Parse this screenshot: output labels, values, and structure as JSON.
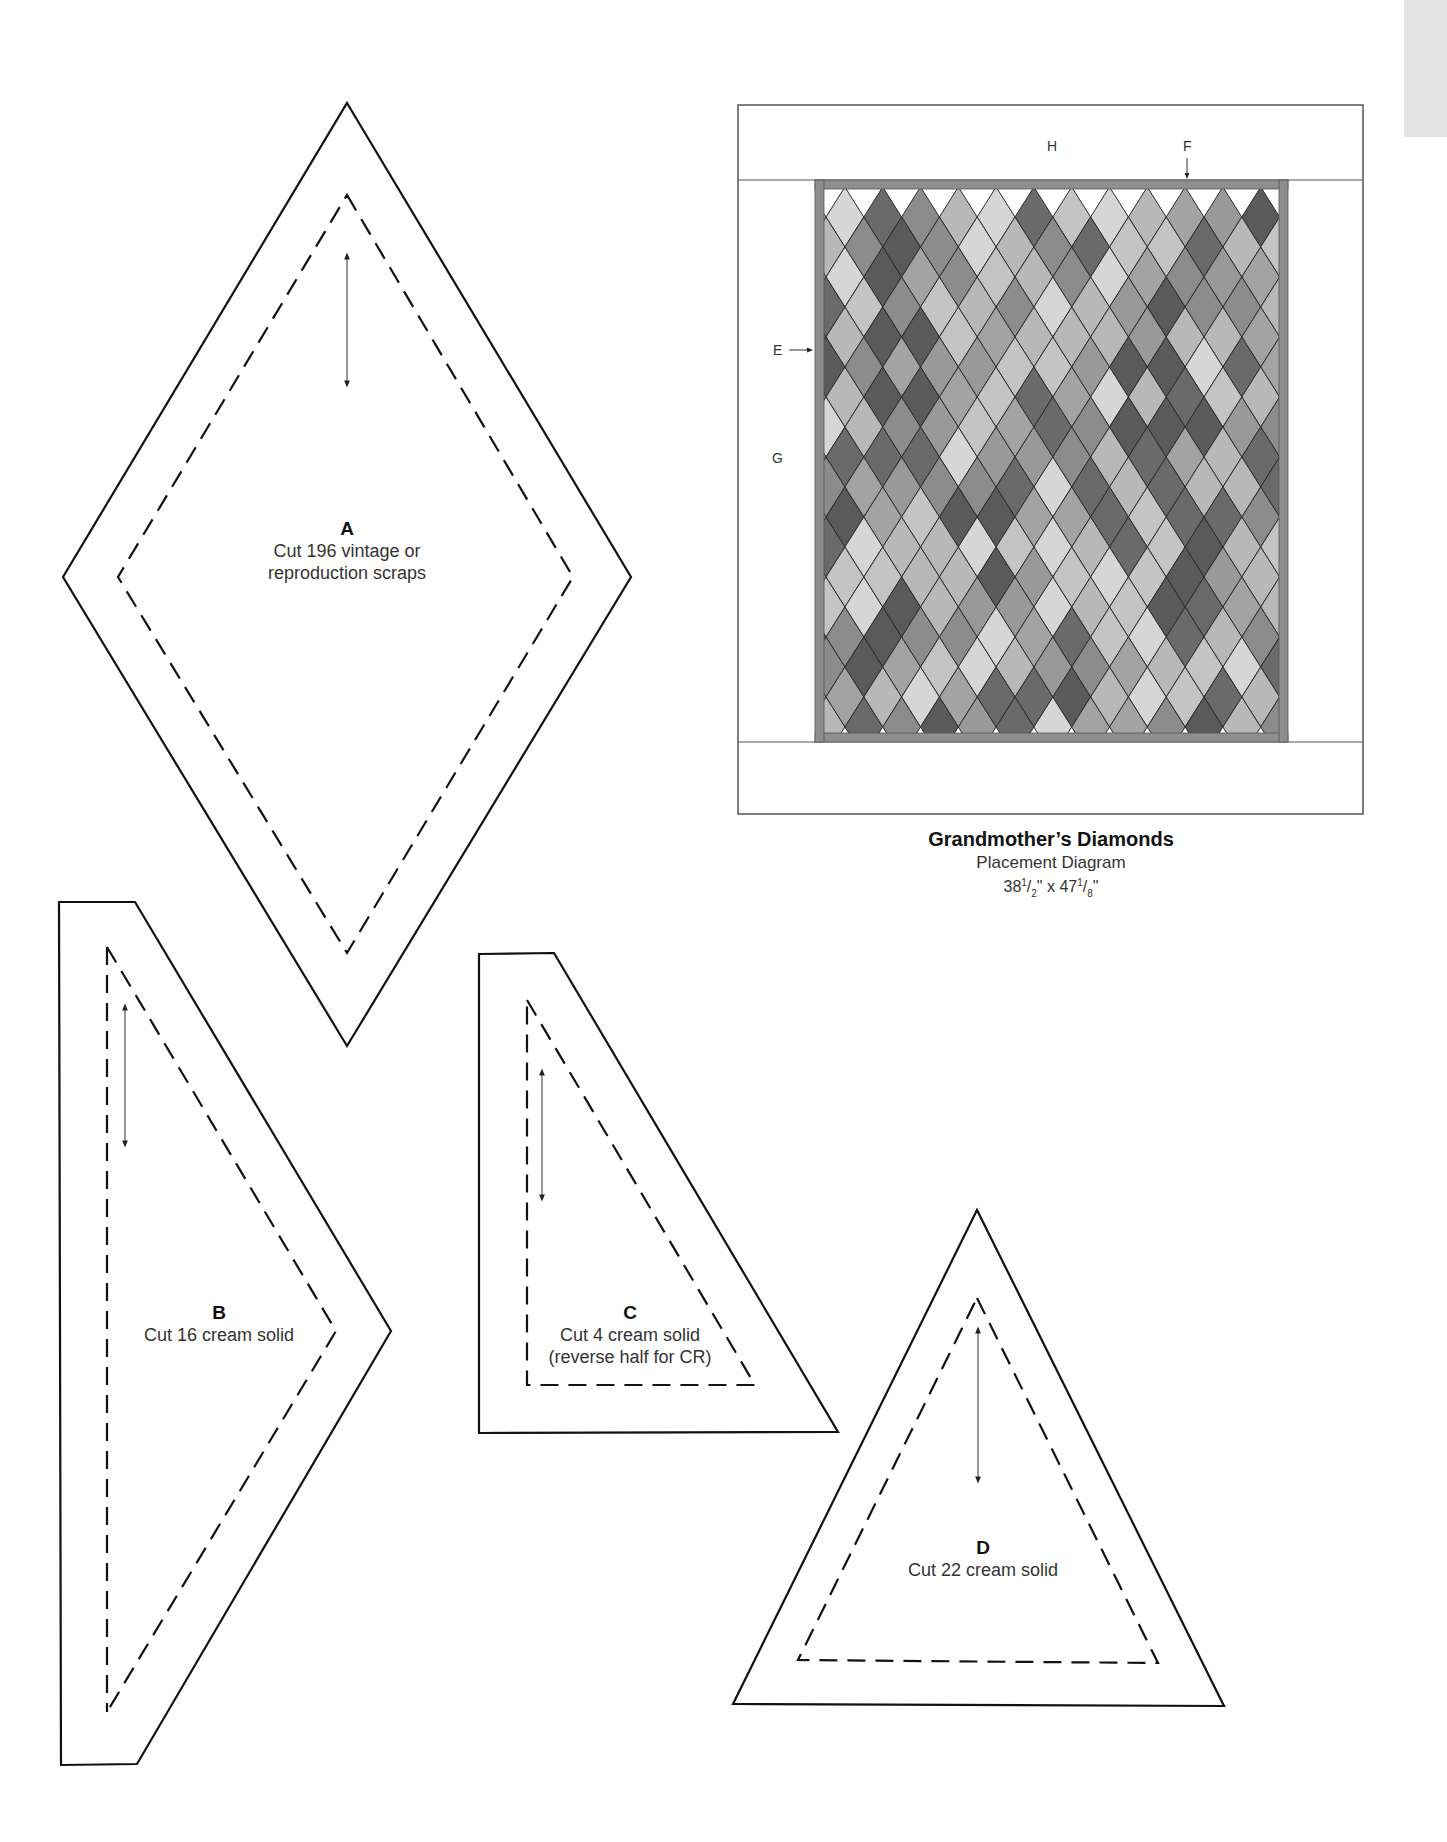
{
  "page": {
    "tab_color": "#e4e4e4"
  },
  "templates": [
    {
      "id": "A",
      "letter": "A",
      "lines": [
        "Cut 196 vintage or",
        "reproduction scraps"
      ],
      "shape": "diamond",
      "outer": [
        [
          347,
          103
        ],
        [
          631,
          577
        ],
        [
          347,
          1046
        ],
        [
          63,
          577
        ]
      ],
      "inner": [
        [
          347,
          195
        ],
        [
          573,
          577
        ],
        [
          347,
          953
        ],
        [
          118,
          577
        ]
      ],
      "grain_arrow": [
        [
          347,
          256
        ],
        [
          347,
          384
        ]
      ],
      "label_pos": [
        347,
        518
      ]
    },
    {
      "id": "B",
      "letter": "B",
      "lines": [
        "Cut 16 cream solid"
      ],
      "shape": "half-diamond-trimmed",
      "outer": [
        [
          59,
          902
        ],
        [
          135,
          902
        ],
        [
          391,
          1331
        ],
        [
          137,
          1764
        ],
        [
          61,
          1765
        ]
      ],
      "inner": [
        [
          107,
          947
        ],
        [
          336,
          1331
        ],
        [
          107,
          1712
        ]
      ],
      "grain_arrow": [
        [
          125,
          1007
        ],
        [
          125,
          1144
        ]
      ],
      "label_pos": [
        219,
        1302
      ]
    },
    {
      "id": "C",
      "letter": "C",
      "lines": [
        "Cut 4 cream solid",
        "(reverse half for CR)"
      ],
      "shape": "right-triangle-trimmed",
      "outer": [
        [
          479,
          954
        ],
        [
          554,
          953
        ],
        [
          838,
          1432
        ],
        [
          479,
          1433
        ]
      ],
      "inner": [
        [
          527,
          1000
        ],
        [
          755,
          1385
        ],
        [
          527,
          1385
        ]
      ],
      "grain_arrow": [
        [
          542,
          1072
        ],
        [
          542,
          1198
        ]
      ],
      "label_pos": [
        630,
        1302
      ]
    },
    {
      "id": "D",
      "letter": "D",
      "lines": [
        "Cut 22 cream solid"
      ],
      "shape": "equilateral-triangle",
      "outer": [
        [
          977,
          1210
        ],
        [
          1224,
          1706
        ],
        [
          733,
          1704
        ]
      ],
      "inner": [
        [
          977,
          1298
        ],
        [
          1158,
          1663
        ],
        [
          798,
          1660
        ]
      ],
      "grain_arrow": [
        [
          978,
          1330
        ],
        [
          978,
          1480
        ]
      ],
      "label_pos": [
        983,
        1537
      ]
    }
  ],
  "placement_diagram": {
    "title": "Grandmother’s Diamonds",
    "subtitle": "Placement Diagram",
    "size_parts": {
      "w_int": "38",
      "w_num": "1",
      "w_den": "2",
      "h_int": "47",
      "h_num": "1",
      "h_den": "8"
    },
    "border_labels": {
      "H": "H",
      "F": "F",
      "E": "E",
      "G": "G"
    },
    "colors": {
      "outline": "#555555",
      "border_stripe": "#8e8e8e",
      "diamond_line": "#2a2a2a",
      "background": "#ffffff",
      "shades": [
        "#6a6a6a",
        "#8c8c8c",
        "#a3a3a3",
        "#b8b8b8",
        "#d6d6d6",
        "#5a5a5a",
        "#999999",
        "#c4c4c4"
      ]
    },
    "grid": {
      "columns": 12,
      "rows": 18,
      "diamond_w": 37.8,
      "diamond_h": 60,
      "x0": 826,
      "y0": 187
    }
  }
}
